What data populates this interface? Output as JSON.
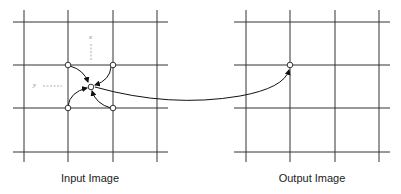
{
  "diagram": {
    "input_label": "Input Image",
    "output_label": "Output Image",
    "axis_x_label": "x",
    "axis_y_label": "y",
    "grid_size": 4,
    "line_color": "#333333",
    "node_fill": "#ffffff",
    "dashed_color": "#9a9a9a",
    "input_grid": {
      "neighbor_nodes": [
        "top-left",
        "top-right",
        "bottom-left",
        "bottom-right"
      ],
      "sample_point": "center"
    },
    "output_grid": {
      "target_node": "row-2-col-2"
    },
    "mapping_arrow": "output node maps back to input sample point"
  }
}
